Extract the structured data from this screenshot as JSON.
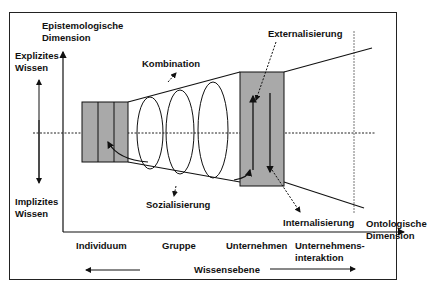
{
  "y_axis": {
    "title_line1": "Epistemologische",
    "title_line2": "Dimension",
    "top_line1": "Explizites",
    "top_line2": "Wissen",
    "bottom_line1": "Implizites",
    "bottom_line2": "Wissen"
  },
  "x_axis": {
    "title_line1": "Ontologische",
    "title_line2": "Dimension",
    "levels": [
      "Individuum",
      "Gruppe",
      "Unternehmen",
      "Unternehmens-",
      "interaktion"
    ],
    "scale_label": "Wissensebene"
  },
  "processes": {
    "kombination": "Kombination",
    "externalisierung": "Externalisierung",
    "sozialisierung": "Sozialisierung",
    "internalisierung": "Internalisierung"
  },
  "colors": {
    "box_fill": "#a9a9a9",
    "line": "#111111"
  }
}
